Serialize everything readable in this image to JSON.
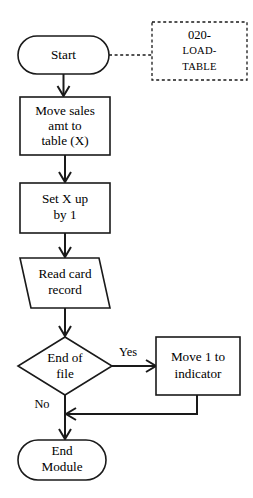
{
  "diagram": {
    "background_color": "#ffffff",
    "line_color": "#1a1a1a",
    "nodes": {
      "start": {
        "shape": "terminator",
        "label_lines": [
          "Start"
        ],
        "line1": "Start"
      },
      "move_sales": {
        "shape": "process",
        "line1": "Move sales",
        "line2": "amt to",
        "line3": "table (X)"
      },
      "set_x": {
        "shape": "process",
        "line1": "Set X up",
        "line2": "by 1"
      },
      "read_card": {
        "shape": "input-output",
        "line1": "Read card",
        "line2": "record"
      },
      "end_of_file": {
        "shape": "decision",
        "line1": "End of",
        "line2": "file"
      },
      "move_indicator": {
        "shape": "process",
        "line1": "Move 1 to",
        "line2": "indicator"
      },
      "end_module": {
        "shape": "terminator",
        "line1": "End",
        "line2": "Module"
      }
    },
    "branch_labels": {
      "yes": "Yes",
      "no": "No"
    },
    "annotation": {
      "shape": "comment",
      "line1": "020-",
      "line2": "LOAD-",
      "line3": "TABLE"
    }
  }
}
